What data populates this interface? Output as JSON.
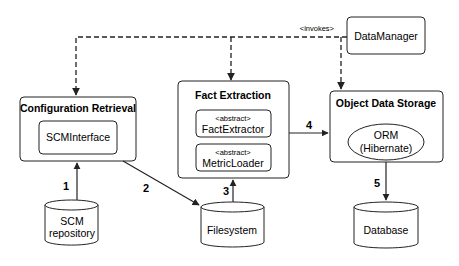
{
  "diagram": {
    "invokes_label": "<invokes>",
    "data_manager": {
      "label": "DataManager"
    },
    "configuration_retrieval": {
      "title": "Configuration Retrieval",
      "component": "SCMInterface"
    },
    "fact_extraction": {
      "title": "Fact Extraction",
      "components": [
        {
          "stereotype": "<abstract>",
          "name": "FactExtractor"
        },
        {
          "stereotype": "<abstract>",
          "name": "MetricLoader"
        }
      ]
    },
    "object_data_storage": {
      "title": "Object Data Storage",
      "orm_line1": "ORM",
      "orm_line2": "(Hibernate)"
    },
    "stores": {
      "scm": {
        "line1": "SCM",
        "line2": "repository"
      },
      "filesystem": {
        "label": "Filesystem"
      },
      "database": {
        "label": "Database"
      }
    },
    "edges": [
      {
        "label": "1",
        "from": "SCM repository",
        "to": "Configuration Retrieval"
      },
      {
        "label": "2",
        "from": "Configuration Retrieval",
        "to": "Filesystem"
      },
      {
        "label": "3",
        "from": "Filesystem",
        "to": "Fact Extraction"
      },
      {
        "label": "4",
        "from": "Fact Extraction",
        "to": "Object Data Storage"
      },
      {
        "label": "5",
        "from": "Object Data Storage",
        "to": "Database"
      }
    ],
    "colors": {
      "stroke": "#222222",
      "fill": "#ffffff",
      "text": "#111111"
    }
  }
}
